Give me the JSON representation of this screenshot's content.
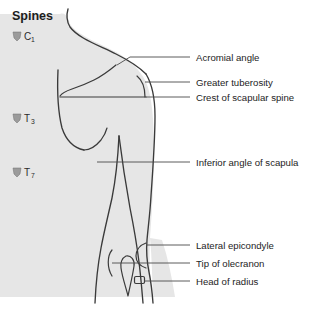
{
  "figure": {
    "title": "Spines",
    "colors": {
      "background": "#ffffff",
      "body_fill": "#e6e6e6",
      "outline": "#3a3a3a",
      "leader": "#4a4a4a",
      "text": "#1d1d1d",
      "vertebra_glyph": "#9b9b9b"
    }
  },
  "spine_levels": [
    {
      "id": "c1",
      "letter": "C",
      "subscript": "1",
      "icon": "vertebra-icon",
      "x": 12,
      "y": 34
    },
    {
      "id": "t3",
      "letter": "T",
      "subscript": "3",
      "icon": "vertebra-icon",
      "x": 12,
      "y": 118
    },
    {
      "id": "t7",
      "letter": "T",
      "subscript": "7",
      "icon": "vertebra-icon",
      "x": 12,
      "y": 172
    }
  ],
  "labels": [
    {
      "id": "acromial-angle",
      "text": "Acromial angle",
      "text_x": 196,
      "text_y": 60,
      "leader": {
        "x1": 190,
        "y1": 57,
        "x2": 130,
        "y2": 57,
        "x3": 116,
        "y3": 65
      }
    },
    {
      "id": "greater-tuberosity",
      "text": "Greater tuberosity",
      "text_x": 196,
      "text_y": 85,
      "leader": {
        "x1": 190,
        "y1": 82,
        "x2": 152,
        "y2": 82,
        "x3": 146,
        "y3": 82
      }
    },
    {
      "id": "crest-of-scapular-spine",
      "text": "Crest of scapular spine",
      "text_x": 196,
      "text_y": 100,
      "leader": {
        "x1": 190,
        "y1": 97,
        "x2": 88,
        "y2": 97,
        "x3": 88,
        "y3": 97
      }
    },
    {
      "id": "inferior-angle-of-scapula",
      "text": "Inferior angle of scapula",
      "text_x": 196,
      "text_y": 165,
      "leader": {
        "x1": 190,
        "y1": 162,
        "x2": 97,
        "y2": 162,
        "x3": 97,
        "y3": 162
      }
    },
    {
      "id": "lateral-epicondyle",
      "text": "Lateral epicondyle",
      "text_x": 196,
      "text_y": 248,
      "leader": {
        "x1": 190,
        "y1": 245,
        "x2": 152,
        "y2": 245,
        "x3": 145,
        "y3": 248
      }
    },
    {
      "id": "tip-of-olecranon",
      "text": "Tip of olecranon",
      "text_x": 196,
      "text_y": 266,
      "leader": {
        "x1": 190,
        "y1": 263,
        "x2": 125,
        "y2": 263,
        "x3": 118,
        "y3": 263
      }
    },
    {
      "id": "head-of-radius",
      "text": "Head of radius",
      "text_x": 196,
      "text_y": 284,
      "leader": {
        "x1": 190,
        "y1": 281,
        "x2": 145,
        "y2": 281,
        "x3": 139,
        "y3": 281
      }
    }
  ]
}
